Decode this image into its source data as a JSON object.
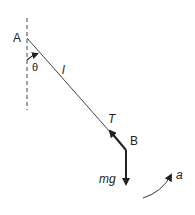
{
  "diagram": {
    "points": {
      "A": {
        "label": "A"
      },
      "B": {
        "label": "B"
      }
    },
    "labels": {
      "angle": "θ",
      "length": "l",
      "tension": "T",
      "weight": "mg",
      "acceleration": "a"
    },
    "colors": {
      "line": "#333333",
      "text": "#222222",
      "background": "#ffffff"
    }
  }
}
